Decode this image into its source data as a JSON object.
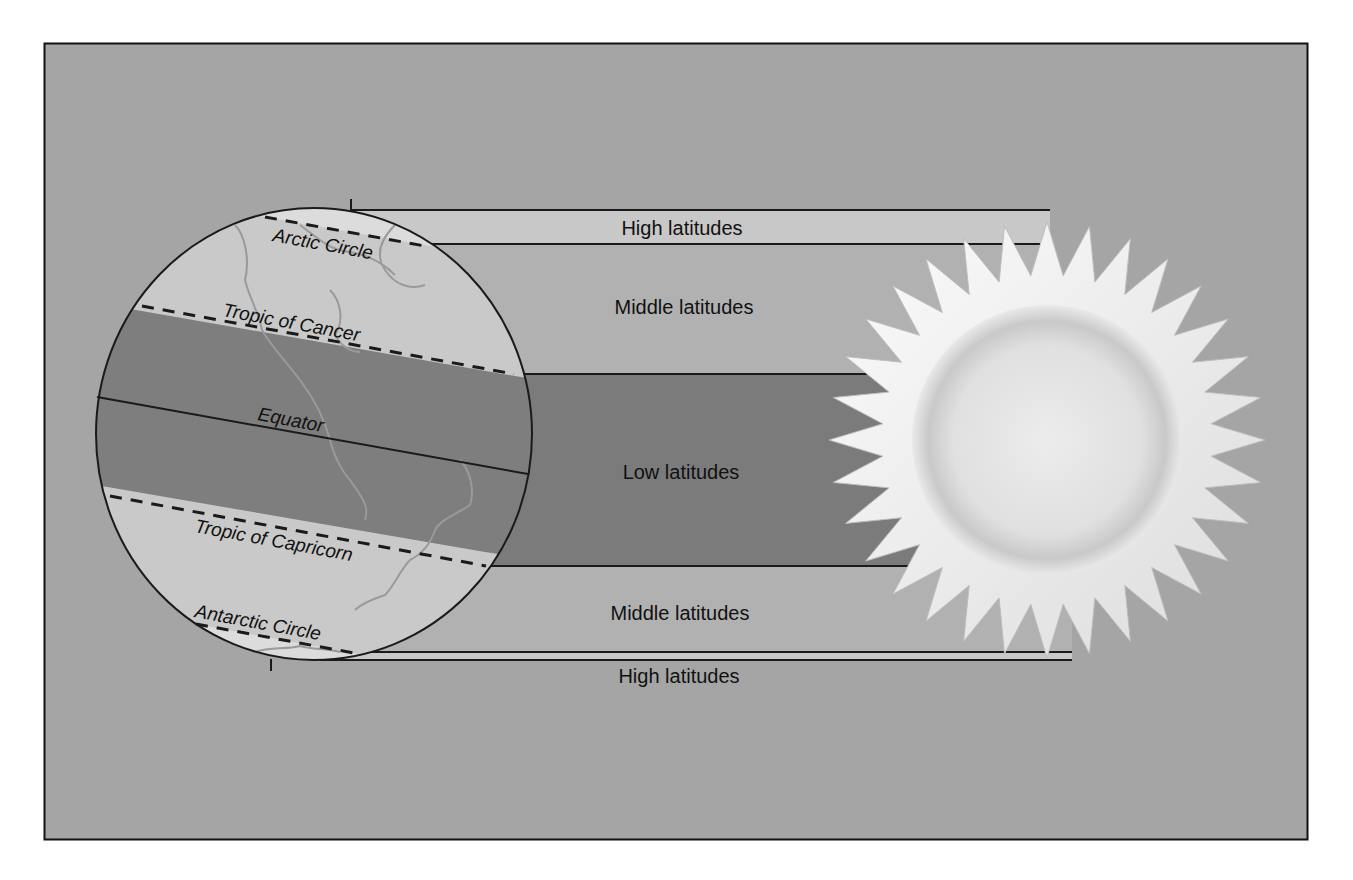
{
  "diagram": {
    "colors": {
      "page": "#ffffff",
      "frame_fill": "#a5a5a5",
      "frame_border": "#111111",
      "high_band": "#c8c8c8",
      "middle_band": "#b1b1b1",
      "low_band": "#7b7b7b",
      "globe_light": "#c9c9c9",
      "globe_dark": "#7e7e7e",
      "polar_cap": "#dcdcdc",
      "continent_outline": "#9a9a9a",
      "sun_ray": "#f4f4f4",
      "sun_core": "#e6e6e6",
      "line": "#1a1a1a"
    },
    "bands": {
      "high_top": "High latitudes",
      "middle_top": "Middle latitudes",
      "low": "Low latitudes",
      "middle_bottom": "Middle latitudes",
      "high_bottom": "High latitudes"
    },
    "globe": {
      "arctic_circle": "Arctic Circle",
      "tropic_of_cancer": "Tropic of Cancer",
      "equator": "Equator",
      "tropic_of_capricorn": "Tropic of Capricorn",
      "antarctic_circle": "Antarctic Circle"
    },
    "sun": {
      "label": "Sun",
      "ray_count": 32
    }
  }
}
